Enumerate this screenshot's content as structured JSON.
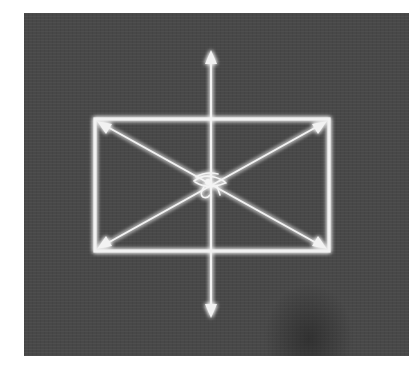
{
  "image": {
    "description": "Glowing white diagram on dark textured background: rectangle with two diagonal double-headed arrows and a vertical double-headed arrow crossing at center, with an Eye of Horus symbol at the intersection",
    "colors": {
      "background": "#ffffff",
      "panel": "#484848",
      "line": "#f2f2f2",
      "glow": "#ffffff"
    },
    "elements": {
      "rectangle": {
        "x1": 94,
        "y1": 118,
        "x2": 330,
        "y2": 252
      },
      "vertical_arrow": {
        "x": 211,
        "y_top": 50,
        "y_bottom": 318
      },
      "diagonal_arrow_1": {
        "from": [
          97,
          121
        ],
        "to": [
          327,
          249
        ]
      },
      "diagonal_arrow_2": {
        "from": [
          97,
          249
        ],
        "to": [
          327,
          121
        ]
      },
      "center_symbol": {
        "name": "eye-of-horus",
        "x": 211,
        "y": 185
      }
    }
  }
}
